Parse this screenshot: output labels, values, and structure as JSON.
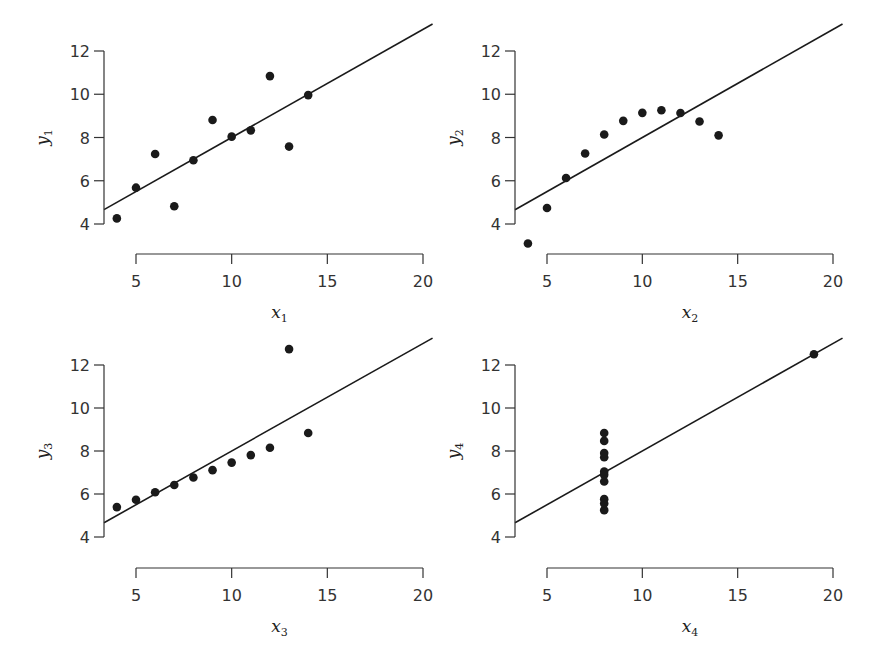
{
  "chart_data": [
    {
      "type": "scatter",
      "title": "",
      "xlabel": "x1",
      "xlabel_base": "x",
      "xlabel_sub": "1",
      "ylabel": "y1",
      "ylabel_base": "y",
      "ylabel_sub": "1",
      "x": [
        10,
        8,
        13,
        9,
        11,
        14,
        6,
        4,
        12,
        7,
        5
      ],
      "y": [
        8.04,
        6.95,
        7.58,
        8.81,
        8.33,
        9.96,
        7.24,
        4.26,
        10.84,
        4.82,
        5.68
      ],
      "fit_line": {
        "intercept": 3.0,
        "slope": 0.5,
        "x_range": [
          3,
          20.5
        ]
      },
      "xticks": [
        5,
        10,
        15,
        20
      ],
      "yticks": [
        4,
        6,
        8,
        10,
        12
      ],
      "xlim": [
        5,
        20
      ],
      "ylim": [
        4,
        12
      ],
      "grid": false
    },
    {
      "type": "scatter",
      "title": "",
      "xlabel": "x2",
      "xlabel_base": "x",
      "xlabel_sub": "2",
      "ylabel": "y2",
      "ylabel_base": "y",
      "ylabel_sub": "2",
      "x": [
        10,
        8,
        13,
        9,
        11,
        14,
        6,
        4,
        12,
        7,
        5
      ],
      "y": [
        9.14,
        8.14,
        8.74,
        8.77,
        9.26,
        8.1,
        6.13,
        3.1,
        9.13,
        7.26,
        4.74
      ],
      "fit_line": {
        "intercept": 3.0,
        "slope": 0.5,
        "x_range": [
          3,
          20.5
        ]
      },
      "xticks": [
        5,
        10,
        15,
        20
      ],
      "yticks": [
        4,
        6,
        8,
        10,
        12
      ],
      "xlim": [
        5,
        20
      ],
      "ylim": [
        4,
        12
      ],
      "grid": false
    },
    {
      "type": "scatter",
      "title": "",
      "xlabel": "x3",
      "xlabel_base": "x",
      "xlabel_sub": "3",
      "ylabel": "y3",
      "ylabel_base": "y",
      "ylabel_sub": "3",
      "x": [
        10,
        8,
        13,
        9,
        11,
        14,
        6,
        4,
        12,
        7,
        5
      ],
      "y": [
        7.46,
        6.77,
        12.74,
        7.11,
        7.81,
        8.84,
        6.08,
        5.39,
        8.15,
        6.42,
        5.73
      ],
      "fit_line": {
        "intercept": 3.0,
        "slope": 0.5,
        "x_range": [
          3,
          20.5
        ]
      },
      "xticks": [
        5,
        10,
        15,
        20
      ],
      "yticks": [
        4,
        6,
        8,
        10,
        12
      ],
      "xlim": [
        5,
        20
      ],
      "ylim": [
        4,
        12
      ],
      "grid": false
    },
    {
      "type": "scatter",
      "title": "",
      "xlabel": "x4",
      "xlabel_base": "x",
      "xlabel_sub": "4",
      "ylabel": "y4",
      "ylabel_base": "y",
      "ylabel_sub": "4",
      "x": [
        8,
        8,
        8,
        8,
        8,
        8,
        8,
        19,
        8,
        8,
        8
      ],
      "y": [
        6.58,
        5.76,
        7.71,
        8.84,
        8.47,
        7.04,
        5.25,
        12.5,
        5.56,
        7.91,
        6.89
      ],
      "fit_line": {
        "intercept": 3.0,
        "slope": 0.5,
        "x_range": [
          3,
          20.5
        ]
      },
      "xticks": [
        5,
        10,
        15,
        20
      ],
      "yticks": [
        4,
        6,
        8,
        10,
        12
      ],
      "xlim": [
        5,
        20
      ],
      "ylim": [
        4,
        12
      ],
      "grid": false
    }
  ],
  "layout": {
    "panels": [
      {
        "yaxis_x": 104,
        "y12": 51,
        "y4": 224,
        "xaxis_y": 254,
        "x5": 136,
        "x20": 423
      },
      {
        "yaxis_x": 515,
        "y12": 51,
        "y4": 224,
        "xaxis_y": 254,
        "x5": 547,
        "x20": 833
      },
      {
        "yaxis_x": 104,
        "y12": 365,
        "y4": 537,
        "xaxis_y": 568,
        "x5": 136,
        "x20": 423
      },
      {
        "yaxis_x": 515,
        "y12": 365,
        "y4": 537,
        "xaxis_y": 568,
        "x5": 547,
        "x20": 833
      }
    ],
    "colors": {
      "ink": "#1a1a1a",
      "axis": "#333333"
    }
  }
}
